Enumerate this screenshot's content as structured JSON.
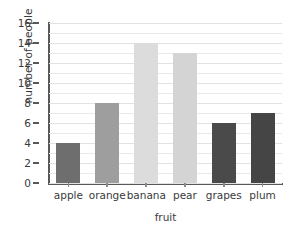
{
  "chart_data": {
    "type": "bar",
    "title": "",
    "xlabel": "fruit",
    "ylabel": "number of people",
    "categories": [
      "apple",
      "orange",
      "banana",
      "pear",
      "grapes",
      "plum"
    ],
    "values": [
      4,
      8,
      14,
      13,
      6,
      7
    ],
    "bar_colors": [
      "#6e6e6e",
      "#9e9e9e",
      "#dcdcdc",
      "#d4d4d4",
      "#4a4a4a",
      "#454545"
    ],
    "ylim": [
      0,
      16
    ],
    "ytick_labels": [
      "0",
      "2",
      "4",
      "6",
      "8",
      "10",
      "12",
      "14",
      "16"
    ],
    "ytick_values": [
      0,
      2,
      4,
      6,
      8,
      10,
      12,
      14,
      16
    ],
    "minor_gridline_step": 1,
    "grid": true,
    "legend": "none",
    "axis_color": "#585858",
    "gridline_color": "#e9e9e9"
  }
}
